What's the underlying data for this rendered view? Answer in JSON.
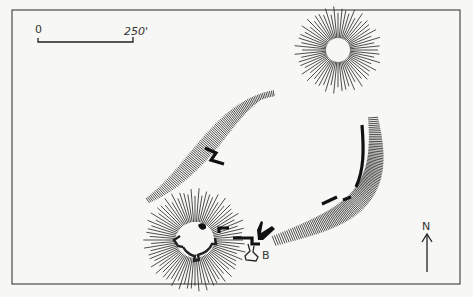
{
  "diagram": {
    "type": "archaeological-site-plan",
    "colors": {
      "ink": "#222222",
      "paper": "#f7f7f5",
      "frame": "#4a4a4a"
    },
    "scale_bar": {
      "start_label": "0",
      "end_label": "250'"
    },
    "north_arrow": {
      "label": "N"
    },
    "labels": {
      "building_b": "B"
    },
    "features": [
      {
        "name": "north-east-mound",
        "kind": "radial-hachure-mound"
      },
      {
        "name": "north-west-bank",
        "kind": "linear-hachure-scarp"
      },
      {
        "name": "east-bank",
        "kind": "curved-hachure-scarp"
      },
      {
        "name": "south-west-motte",
        "kind": "radial-hachure-mound-with-shell-keep"
      },
      {
        "name": "central-wall-fragment",
        "kind": "wall"
      },
      {
        "name": "east-curtain-wall",
        "kind": "wall-segments"
      },
      {
        "name": "gate-walls",
        "kind": "wall"
      },
      {
        "name": "building-b",
        "kind": "structure"
      }
    ]
  }
}
